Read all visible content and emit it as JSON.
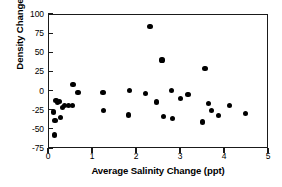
{
  "chart_data": {
    "type": "scatter",
    "title": "",
    "xlabel": "Average Salinity Change (ppt)",
    "ylabel": "Density Change (%)",
    "xlim": [
      0,
      5
    ],
    "ylim": [
      -75,
      100
    ],
    "xticks": [
      "0",
      "1",
      "2",
      "3",
      "4",
      "5"
    ],
    "xtick_values": [
      0,
      1,
      2,
      3,
      4,
      5
    ],
    "yticks": [
      "100",
      "75",
      "50",
      "25",
      "0",
      "-25",
      "-50",
      "-75"
    ],
    "ytick_values": [
      100,
      75,
      50,
      25,
      0,
      -25,
      -50,
      -75
    ],
    "grid": false,
    "legend": null,
    "marker": "filled-circle",
    "marker_color": "#000000",
    "series": [
      {
        "name": "samples",
        "points": [
          [
            0.13,
            -28
          ],
          [
            0.14,
            -58
          ],
          [
            0.16,
            -39
          ],
          [
            0.18,
            -13
          ],
          [
            0.21,
            -16
          ],
          [
            0.27,
            -14
          ],
          [
            0.28,
            -35
          ],
          [
            0.33,
            -22
          ],
          [
            0.38,
            -20
          ],
          [
            0.47,
            -20
          ],
          [
            0.55,
            -20
          ],
          [
            0.57,
            8
          ],
          [
            0.68,
            -3
          ],
          [
            1.25,
            -2
          ],
          [
            1.27,
            -26
          ],
          [
            1.83,
            -32
          ],
          [
            1.85,
            0
          ],
          [
            2.22,
            -4
          ],
          [
            2.32,
            84
          ],
          [
            2.47,
            -15
          ],
          [
            2.59,
            40
          ],
          [
            2.63,
            -34
          ],
          [
            2.81,
            0
          ],
          [
            2.83,
            -36
          ],
          [
            3.01,
            -10
          ],
          [
            3.18,
            -5
          ],
          [
            3.52,
            -41
          ],
          [
            3.57,
            29
          ],
          [
            3.64,
            -17
          ],
          [
            3.72,
            -26
          ],
          [
            3.88,
            -33
          ],
          [
            4.13,
            -19
          ],
          [
            4.49,
            -30
          ]
        ]
      }
    ]
  }
}
